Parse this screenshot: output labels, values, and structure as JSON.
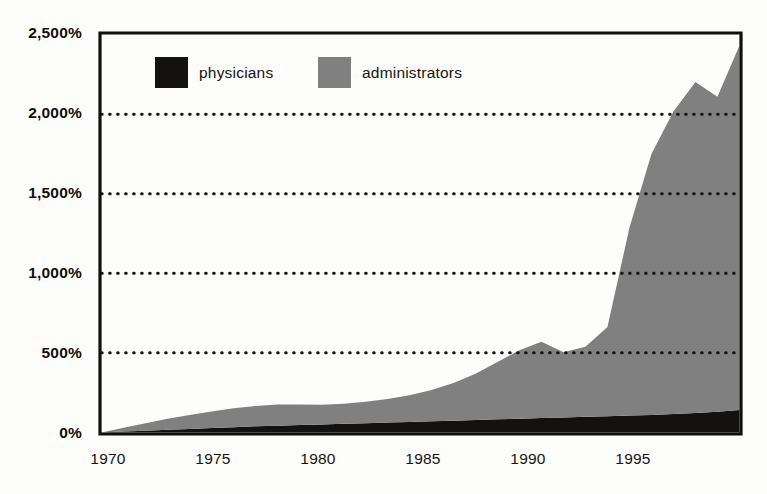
{
  "chart_data": {
    "type": "area",
    "title": "",
    "subtitle": "",
    "xlabel": "",
    "ylabel": "",
    "stacked": true,
    "grid": true,
    "grid_style": "dotted-horizontal",
    "legend_position": "top-left-inside",
    "xlim": [
      1970,
      1999
    ],
    "ylim": [
      0,
      2500
    ],
    "ytick_labels": [
      "0%",
      "500%",
      "1,000%",
      "1,500%",
      "2,000%",
      "2,500%"
    ],
    "ytick_values": [
      0,
      500,
      1000,
      1500,
      2000,
      2500
    ],
    "xtick_labels": [
      "1970",
      "1975",
      "1980",
      "1985",
      "1990",
      "1995"
    ],
    "xtick_values": [
      1970,
      1975,
      1980,
      1985,
      1990,
      1995
    ],
    "x": [
      1970,
      1971,
      1972,
      1973,
      1974,
      1975,
      1976,
      1977,
      1978,
      1979,
      1980,
      1981,
      1982,
      1983,
      1984,
      1985,
      1986,
      1987,
      1988,
      1989,
      1990,
      1991,
      1992,
      1993,
      1994,
      1995,
      1996,
      1997,
      1998,
      1999
    ],
    "series": [
      {
        "name": "physicians",
        "color": "#131210",
        "values": [
          0,
          5,
          10,
          16,
          22,
          28,
          33,
          38,
          42,
          46,
          50,
          54,
          58,
          62,
          66,
          70,
          74,
          78,
          82,
          86,
          90,
          94,
          98,
          102,
          106,
          110,
          116,
          122,
          130,
          140
        ]
      },
      {
        "name": "administrators",
        "color": "#808080",
        "values": [
          0,
          25,
          48,
          70,
          88,
          104,
          118,
          128,
          133,
          130,
          124,
          126,
          134,
          148,
          168,
          196,
          236,
          290,
          360,
          430,
          480,
          410,
          440,
          560,
          1180,
          1640,
          1900,
          2080,
          1980,
          2290
        ]
      }
    ]
  },
  "legend": {
    "items": [
      {
        "label": "physicians",
        "color": "#131210",
        "icon": "square-swatch"
      },
      {
        "label": "administrators",
        "color": "#808080",
        "icon": "square-swatch"
      }
    ]
  },
  "axis": {
    "y_labels": [
      "2,500%",
      "2,000%",
      "1,500%",
      "1,000%",
      "500%",
      "0%"
    ],
    "x_labels": [
      "1970",
      "1975",
      "1980",
      "1985",
      "1990",
      "1995"
    ]
  },
  "colors": {
    "physicians": "#131210",
    "administrators": "#808080",
    "axis": "#100f0d",
    "background": "#fdfdfc",
    "grid": "#161412"
  }
}
